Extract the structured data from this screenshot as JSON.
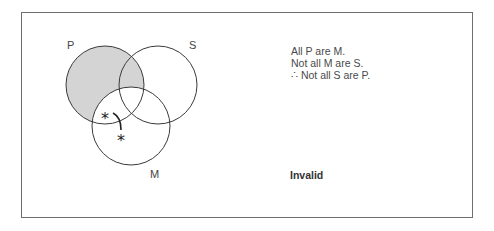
{
  "diagram": {
    "type": "venn",
    "circles": [
      {
        "label": "P",
        "cx": 105,
        "cy": 85,
        "r": 39,
        "shaded": "P minus M"
      },
      {
        "label": "S",
        "cx": 158,
        "cy": 85,
        "r": 39
      },
      {
        "label": "M",
        "cx": 131,
        "cy": 126,
        "r": 39
      }
    ],
    "labels": {
      "p": "P",
      "s": "S",
      "m": "M"
    },
    "marks": {
      "asterisk1": "*",
      "asterisk2": "*"
    },
    "colors": {
      "shade": "#d4d4d4",
      "stroke": "#3a3a3a",
      "frame": "#6e6e6e"
    }
  },
  "argument": {
    "premise1": "All P are M.",
    "premise2": "Not all M are S.",
    "conclusion": "∴ Not all S are P."
  },
  "verdict": "Invalid"
}
